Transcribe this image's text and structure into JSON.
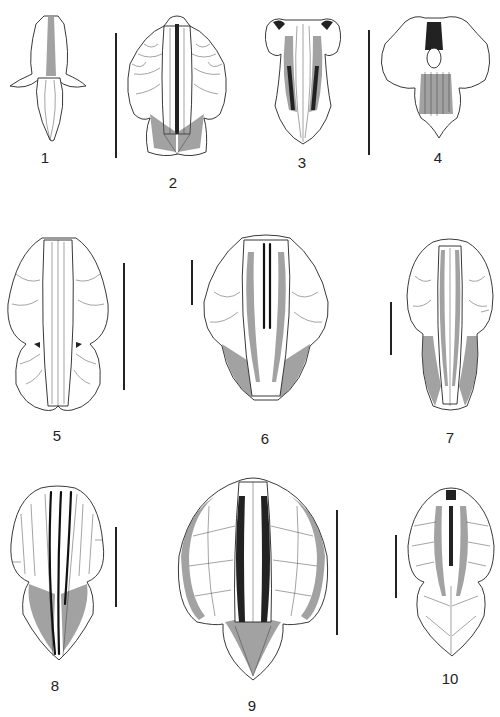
{
  "plate": {
    "type": "botanical line-drawing plate",
    "figures": [
      {
        "id": 1,
        "label": "1"
      },
      {
        "id": 2,
        "label": "2"
      },
      {
        "id": 3,
        "label": "3"
      },
      {
        "id": 4,
        "label": "4"
      },
      {
        "id": 5,
        "label": "5"
      },
      {
        "id": 6,
        "label": "6"
      },
      {
        "id": 7,
        "label": "7"
      },
      {
        "id": 8,
        "label": "8"
      },
      {
        "id": 9,
        "label": "9"
      },
      {
        "id": 10,
        "label": "10"
      }
    ],
    "scale_bars": [
      {
        "between": "1-2",
        "length_px": 125
      },
      {
        "between": "3-4",
        "length_px": 125
      },
      {
        "for": "5",
        "length_px": 127
      },
      {
        "for": "6",
        "length_px": 45
      },
      {
        "for": "7",
        "length_px": 53
      },
      {
        "for": "8",
        "length_px": 80
      },
      {
        "for": "9",
        "length_px": 125
      },
      {
        "for": "10",
        "length_px": 63
      }
    ],
    "colors": {
      "ink": "#222222",
      "background": "#ffffff"
    }
  }
}
